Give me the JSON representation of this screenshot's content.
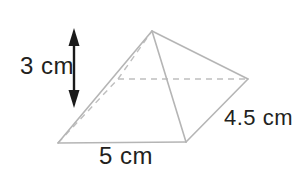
{
  "figure": {
    "kind": "rectangular-pyramid-diagram",
    "background_color": "#ffffff",
    "edge_color": "#b5b5b5",
    "hidden_edge_color": "#bfbfbf",
    "arrow_color": "#1a1a1a",
    "text_color": "#231f20",
    "labels": {
      "height": "3 cm",
      "base": "5 cm",
      "depth": "4.5 cm"
    },
    "measurements": [
      {
        "name": "height",
        "value": 3,
        "unit": "cm",
        "text": "3 cm"
      },
      {
        "name": "base-width",
        "value": 5,
        "unit": "cm",
        "text": "5 cm"
      },
      {
        "name": "base-depth",
        "value": 4.5,
        "unit": "cm",
        "text": "4.5 cm"
      }
    ],
    "vertices": {
      "apex": [
        152,
        31
      ],
      "front_left": [
        58,
        143
      ],
      "front_right": [
        186,
        142
      ],
      "back_right": [
        248,
        79
      ],
      "back_left": [
        118,
        79
      ]
    },
    "visible_edges": [
      {
        "from": "front_left",
        "to": "front_right"
      },
      {
        "from": "front_left",
        "to": "apex"
      },
      {
        "from": "apex",
        "to": "front_right"
      },
      {
        "from": "apex",
        "to": "back_right"
      },
      {
        "from": "front_right",
        "to": "back_right"
      }
    ],
    "hidden_edges": [
      {
        "from": "back_left",
        "to": "back_right",
        "style": "dashed"
      },
      {
        "from": "front_left",
        "to": "back_left",
        "style": "dashed"
      },
      {
        "from": "back_left",
        "to": "apex",
        "style": "dashed"
      }
    ],
    "height_arrow": {
      "x": 74,
      "y_top": 30,
      "y_bottom": 106,
      "style": "double-headed-vertical"
    }
  }
}
